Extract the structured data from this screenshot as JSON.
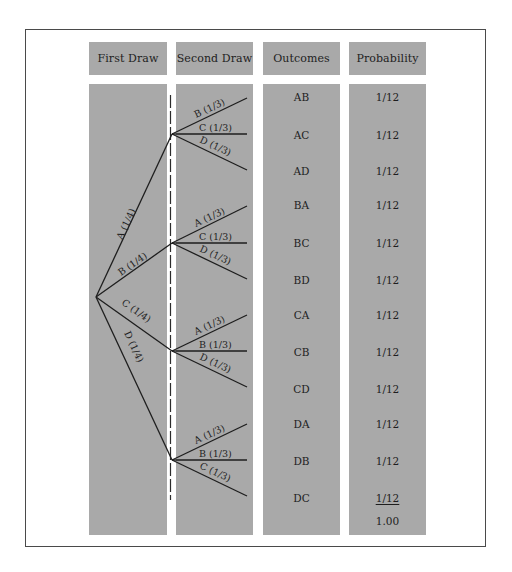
{
  "headers": {
    "first_draw": "First Draw",
    "second_draw": "Second Draw",
    "outcomes": "Outcomes",
    "probability": "Probability"
  },
  "tree": {
    "first_draw": [
      {
        "label": "A (1/4)",
        "second": [
          "B (1/3)",
          "C (1/3)",
          "D (1/3)"
        ]
      },
      {
        "label": "B (1/4)",
        "second": [
          "A (1/3)",
          "C (1/3)",
          "D (1/3)"
        ]
      },
      {
        "label": "C (1/4)",
        "second": [
          "A (1/3)",
          "B (1/3)",
          "D (1/3)"
        ]
      },
      {
        "label": "D (1/4)",
        "second": [
          "A (1/3)",
          "B (1/3)",
          "C (1/3)"
        ]
      }
    ]
  },
  "rows": [
    {
      "outcome": "AB",
      "probability": "1/12"
    },
    {
      "outcome": "AC",
      "probability": "1/12"
    },
    {
      "outcome": "AD",
      "probability": "1/12"
    },
    {
      "outcome": "BA",
      "probability": "1/12"
    },
    {
      "outcome": "BC",
      "probability": "1/12"
    },
    {
      "outcome": "BD",
      "probability": "1/12"
    },
    {
      "outcome": "CA",
      "probability": "1/12"
    },
    {
      "outcome": "CB",
      "probability": "1/12"
    },
    {
      "outcome": "CD",
      "probability": "1/12"
    },
    {
      "outcome": "DA",
      "probability": "1/12"
    },
    {
      "outcome": "DB",
      "probability": "1/12"
    },
    {
      "outcome": "DC",
      "probability": "1/12"
    }
  ],
  "total": "1.00",
  "colors": {
    "panel": "#a9a9a9",
    "line": "#1e1e1e",
    "border": "#4a4a4a"
  }
}
